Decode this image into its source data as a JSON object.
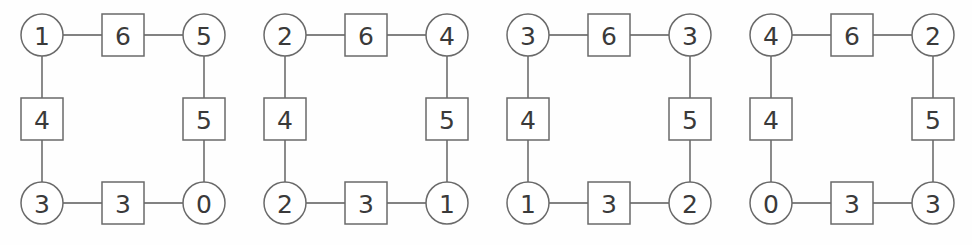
{
  "figure": {
    "type": "graph-diagram-series",
    "count": 4,
    "background_color": "#fefefe",
    "stroke_color": "#6a6a6a",
    "text_color": "#3a3a3a"
  },
  "diagrams": [
    {
      "index": 1,
      "vertices": {
        "top_left": "1",
        "top_right": "5",
        "bottom_left": "3",
        "bottom_right": "0"
      },
      "edges": {
        "top": "6",
        "left": "4",
        "right": "5",
        "bottom": "3"
      }
    },
    {
      "index": 2,
      "vertices": {
        "top_left": "2",
        "top_right": "4",
        "bottom_left": "2",
        "bottom_right": "1"
      },
      "edges": {
        "top": "6",
        "left": "4",
        "right": "5",
        "bottom": "3"
      }
    },
    {
      "index": 3,
      "vertices": {
        "top_left": "3",
        "top_right": "3",
        "bottom_left": "1",
        "bottom_right": "2"
      },
      "edges": {
        "top": "6",
        "left": "4",
        "right": "5",
        "bottom": "3"
      }
    },
    {
      "index": 4,
      "vertices": {
        "top_left": "4",
        "top_right": "2",
        "bottom_left": "0",
        "bottom_right": "3"
      },
      "edges": {
        "top": "6",
        "left": "4",
        "right": "5",
        "bottom": "3"
      }
    }
  ],
  "geometry": {
    "diagram_width": 243,
    "diagram_offsets": [
      0,
      243,
      486,
      729
    ],
    "circle_radius": 21,
    "square_size": 42,
    "left_x": 42,
    "right_x": 204,
    "top_y": 35,
    "bottom_y": 203,
    "mid_x": 123,
    "mid_y": 119
  }
}
